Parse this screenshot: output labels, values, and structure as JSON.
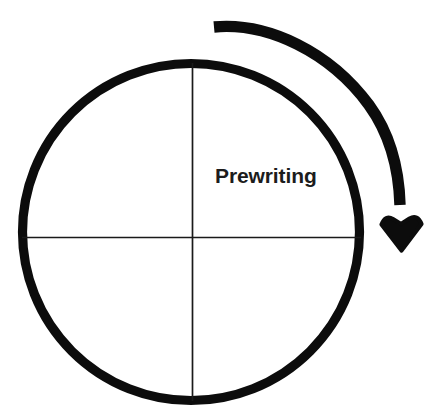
{
  "canvas": {
    "width": 441,
    "height": 420,
    "background": "#ffffff"
  },
  "diagram": {
    "kind": "cyclical-process-diagram",
    "title_text": "",
    "stroke_color": "#000000",
    "line_color": "#1a1a1a",
    "text_color": "#1c1c1c"
  },
  "cycle": {
    "center_x": 191,
    "center_y": 232,
    "radius": 168,
    "stroke_width": 9,
    "divider_stroke_width": 1.6,
    "quadrant_count": 4,
    "labels": [
      {
        "id": "prewriting",
        "text": "Prewriting",
        "quadrant": "upper-right",
        "font_size": 21,
        "bold": true
      }
    ]
  },
  "rotation_arrow": {
    "name": "clockwise-rotation-arrow",
    "direction": "clockwise",
    "stroke_width": 11,
    "radius": 210,
    "start_angle_deg": -95,
    "end_angle_deg": 10,
    "tail_cap": "butt",
    "head": {
      "shape": "barbed-triangle",
      "points_toward": "down",
      "tip_x": 403,
      "tip_y": 249,
      "width": 44,
      "height": 40
    },
    "color": "#000000"
  },
  "icons": {
    "arrow_icon_name": "curved-arrow-clockwise-icon",
    "circle_icon_name": "circle-outline-icon",
    "crosshair_icon_name": "crosshair-divider-icon"
  }
}
